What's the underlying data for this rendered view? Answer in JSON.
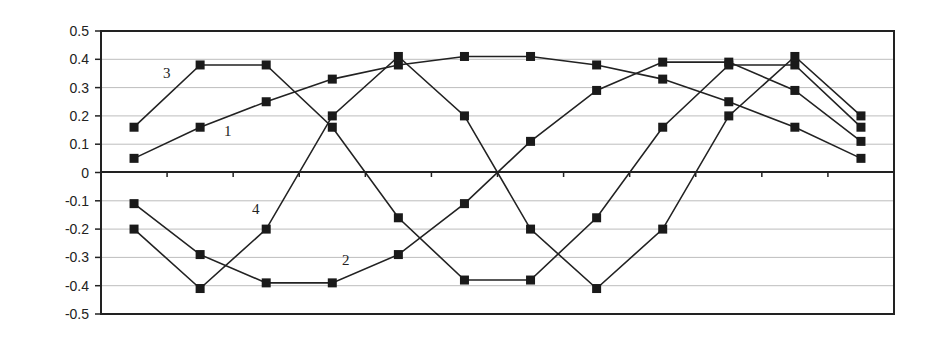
{
  "chart_data": {
    "type": "line",
    "title": "",
    "xlabel": "",
    "ylabel": "",
    "ylim": [
      -0.5,
      0.5
    ],
    "yticks": [
      "0.5",
      "0.4",
      "0.3",
      "0.2",
      "0.1",
      "0",
      "-0.1",
      "-0.2",
      "-0.3",
      "-0.4",
      "-0.5"
    ],
    "grid": true,
    "legend": "none (inline numeric labels)",
    "categories": [
      1,
      2,
      3,
      4,
      5,
      6,
      7,
      8,
      9,
      10,
      11,
      12
    ],
    "series": [
      {
        "name": "1",
        "values": [
          0.05,
          0.16,
          0.25,
          0.33,
          0.38,
          0.41,
          0.41,
          0.38,
          0.33,
          0.25,
          0.16,
          0.05
        ]
      },
      {
        "name": "2",
        "values": [
          -0.11,
          -0.29,
          -0.39,
          -0.39,
          -0.29,
          -0.11,
          0.11,
          0.29,
          0.39,
          0.39,
          0.29,
          0.11
        ]
      },
      {
        "name": "3",
        "values": [
          0.16,
          0.38,
          0.38,
          0.16,
          -0.16,
          -0.38,
          -0.38,
          -0.16,
          0.16,
          0.38,
          0.38,
          0.16
        ]
      },
      {
        "name": "4",
        "values": [
          -0.2,
          -0.41,
          -0.2,
          0.2,
          0.41,
          0.2,
          -0.2,
          -0.41,
          -0.2,
          0.2,
          0.41,
          0.2
        ]
      }
    ],
    "annotations": [
      {
        "text": "3",
        "series": "3"
      },
      {
        "text": "1",
        "series": "1"
      },
      {
        "text": "4",
        "series": "4"
      },
      {
        "text": "2",
        "series": "2"
      }
    ]
  },
  "colors": {
    "line": "#222222",
    "marker": "#1a1a1a",
    "grid": "#bdbdbd",
    "axis": "#222222"
  }
}
